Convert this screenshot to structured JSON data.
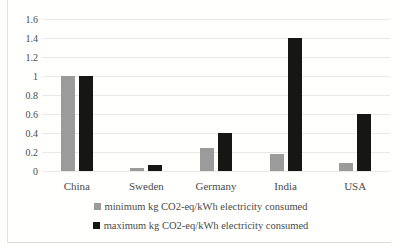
{
  "chart_data": {
    "type": "bar",
    "title": "",
    "categories": [
      "China",
      "Sweden",
      "Germany",
      "India",
      "USA"
    ],
    "series": [
      {
        "name": "minimum kg CO2-eq/kWh electricity consumed",
        "color": "#9b9b9b",
        "values": [
          1.0,
          0.03,
          0.24,
          0.18,
          0.08
        ]
      },
      {
        "name": "maximum kg CO2-eq/kWh electricity consumed",
        "color": "#161614",
        "values": [
          1.0,
          0.06,
          0.4,
          1.4,
          0.6
        ]
      }
    ],
    "ylim": [
      0,
      1.6
    ],
    "ytick_labels": [
      "0",
      "0.2",
      "0.4",
      "0.6",
      "0.8",
      "1",
      "1.2",
      "1.4",
      "1.6"
    ],
    "ytick_values": [
      0,
      0.2,
      0.4,
      0.6,
      0.8,
      1,
      1.2,
      1.4,
      1.6
    ],
    "xlabel": "",
    "ylabel": "",
    "grid": true,
    "legend_position": "bottom"
  },
  "colors": {
    "grid": "#e9e9e5",
    "bar_min": "#9b9b9b",
    "bar_max": "#161614",
    "text": "#4a4a48",
    "background": "#fffffe"
  }
}
